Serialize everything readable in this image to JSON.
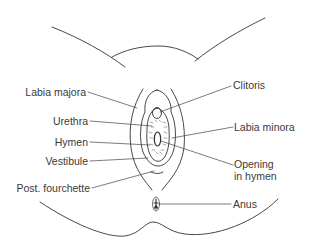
{
  "diagram": {
    "type": "anatomical-illustration",
    "labels_left": [
      {
        "id": "labia-majora",
        "text": "Labia majora"
      },
      {
        "id": "urethra",
        "text": "Urethra"
      },
      {
        "id": "hymen",
        "text": "Hymen"
      },
      {
        "id": "vestibule",
        "text": "Vestibule"
      },
      {
        "id": "post-fourchette",
        "text": "Post. fourchette"
      }
    ],
    "labels_right": [
      {
        "id": "clitoris",
        "text": "Clitoris"
      },
      {
        "id": "labia-minora",
        "text": "Labia minora"
      },
      {
        "id": "opening-in-hymen",
        "text": "Opening in hymen",
        "line1": "Opening",
        "line2": "in hymen"
      },
      {
        "id": "anus",
        "text": "Anus"
      }
    ],
    "colors": {
      "line": "#333333",
      "text": "#3a3a3a",
      "background": "#ffffff"
    }
  }
}
